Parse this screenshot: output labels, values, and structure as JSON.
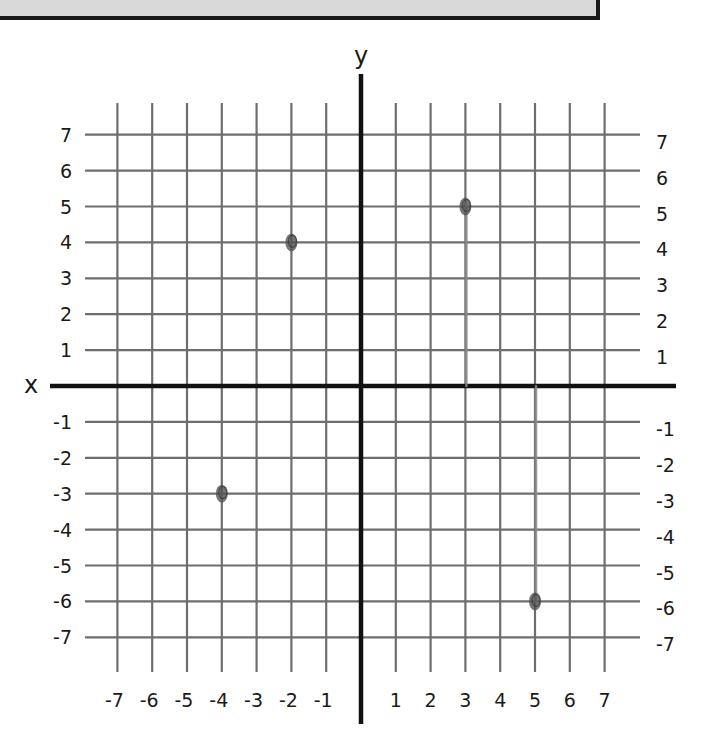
{
  "chart_data": {
    "type": "scatter",
    "title": "",
    "xlabel": "x",
    "ylabel": "y",
    "xlim": [
      -7,
      7
    ],
    "ylim": [
      -7,
      7
    ],
    "grid": true,
    "x_ticks": [
      -7,
      -6,
      -5,
      -4,
      -3,
      -2,
      -1,
      1,
      2,
      3,
      4,
      5,
      6,
      7
    ],
    "y_ticks": [
      7,
      6,
      5,
      4,
      3,
      2,
      1,
      -1,
      -2,
      -3,
      -4,
      -5,
      -6,
      -7
    ],
    "series": [
      {
        "name": "plotted points",
        "points": [
          {
            "x": -2,
            "y": 4
          },
          {
            "x": 3,
            "y": 5
          },
          {
            "x": -4,
            "y": -3
          },
          {
            "x": 5,
            "y": -6
          }
        ]
      }
    ],
    "annotations": [
      {
        "type": "hand-drawn line",
        "from": {
          "x": 3,
          "y": 0
        },
        "to": {
          "x": 3,
          "y": 5
        }
      },
      {
        "type": "hand-drawn line",
        "from": {
          "x": 5,
          "y": 0
        },
        "to": {
          "x": 5,
          "y": -6
        }
      }
    ]
  },
  "colors": {
    "grid": "#6e6e6e",
    "axis": "#111111",
    "point": "#555555",
    "top_box_fill": "#d9d9d9"
  }
}
